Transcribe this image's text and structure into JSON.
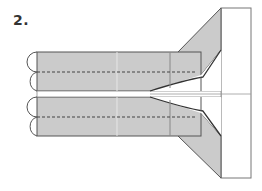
{
  "step": {
    "label": "2."
  },
  "colors": {
    "paper_shaded": "#cbcbcb",
    "paper_white": "#ffffff",
    "line": "#555555",
    "fold_line": "#444444"
  },
  "diagram": {
    "elements": [
      "upper-strip",
      "lower-strip",
      "valley-fold-lines",
      "rounded-edges",
      "upper-flap",
      "lower-flap",
      "right-panel",
      "center-crease"
    ]
  }
}
